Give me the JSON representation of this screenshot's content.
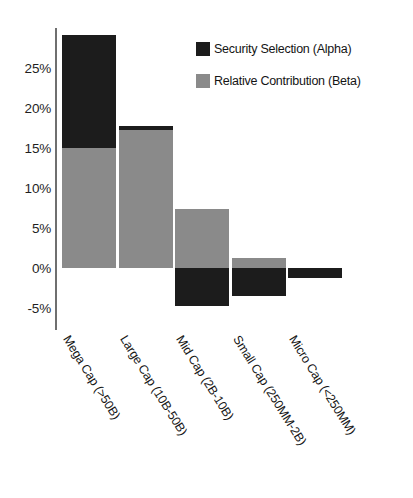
{
  "chart_data": {
    "type": "bar",
    "title": "",
    "subtitle": "",
    "xlabel": "",
    "ylabel": "",
    "stacked": true,
    "grid": false,
    "legend_position": "top-right",
    "ylim": [
      -7.5,
      30
    ],
    "yticks": [
      25,
      20,
      15,
      10,
      5,
      0,
      -5
    ],
    "ytick_labels": [
      "25%",
      "20%",
      "15%",
      "10%",
      "5%",
      "0%",
      "-5%"
    ],
    "categories": [
      "Mega Cap (>50B)",
      "Large Cap (10B-50B)",
      "Mid Cap (2B-10B)",
      "Small Cap (250MM-2B)",
      "Micro Cap (<250MM)"
    ],
    "series": [
      {
        "name": "Security Selection (Alpha)",
        "color": "#1c1c1c",
        "values": [
          14.1,
          0.5,
          -4.8,
          -3.5,
          -1.3
        ]
      },
      {
        "name": "Relative Contribution (Beta)",
        "color": "#8a8a8a",
        "values": [
          15.0,
          17.2,
          7.4,
          1.2,
          0.0
        ]
      }
    ],
    "totals": [
      29.1,
      17.7,
      2.6,
      -2.3,
      -1.3
    ]
  },
  "legend": {
    "items": [
      {
        "label": "Security Selection (Alpha)",
        "color": "#1c1c1c"
      },
      {
        "label": "Relative Contribution (Beta)",
        "color": "#8a8a8a"
      }
    ]
  },
  "axis": {
    "ytick_labels": [
      "25%",
      "20%",
      "15%",
      "10%",
      "5%",
      "0%",
      "-5%"
    ],
    "xtick_labels": [
      "Mega Cap (>50B)",
      "Large Cap (10B-50B)",
      "Mid Cap (2B-10B)",
      "Small Cap (250MM-2B)",
      "Micro Cap (<250MM)"
    ]
  },
  "colors": {
    "alpha": "#1c1c1c",
    "beta": "#8a8a8a",
    "axis": "#6f6f6f",
    "background": "#ffffff",
    "text": "#1a1a1a"
  }
}
